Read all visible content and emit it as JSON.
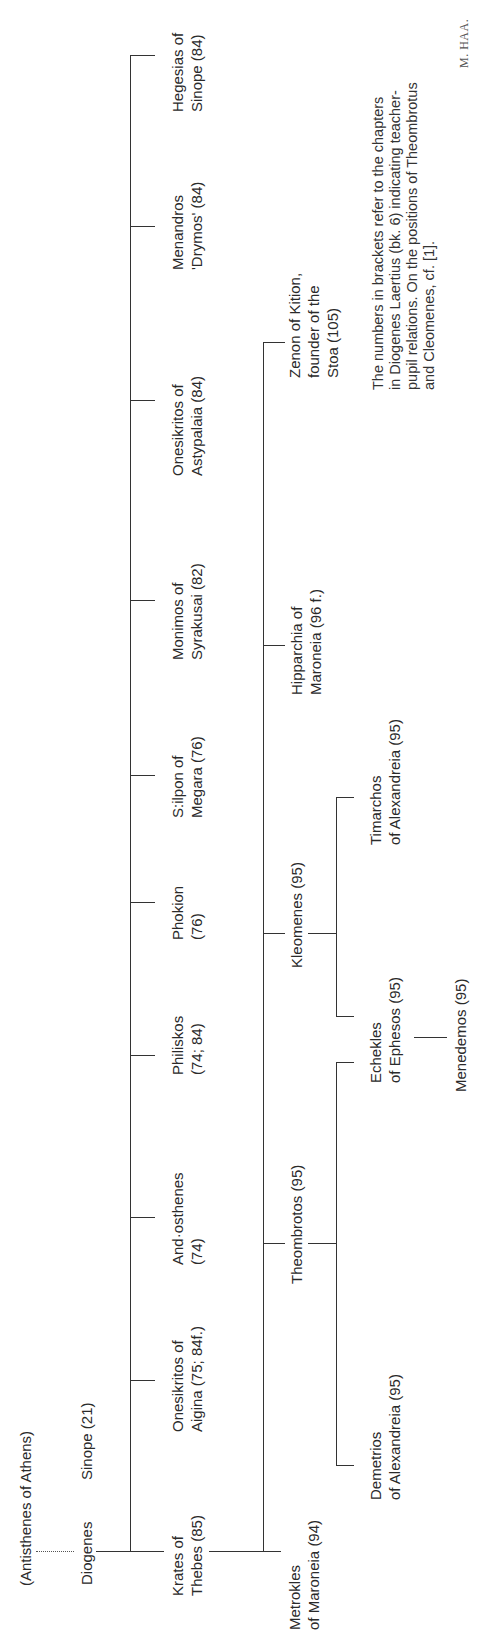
{
  "diagram": {
    "orientation": "rotated-90-ccw",
    "root": {
      "label": "(Antisthenes of Athens)"
    },
    "diogenes": {
      "line1": "Diogenes",
      "line2": "Sinope (21)"
    },
    "pupils_of_diogenes": [
      {
        "line1": "Krates of",
        "line2": "Thebes (85)"
      },
      {
        "line1": "Onesikritos of",
        "line2": "Aigina (75; 84f.)"
      },
      {
        "line1": "And·osthenes",
        "line2": "(74)"
      },
      {
        "line1": "Philiskos",
        "line2": "(74; 84)"
      },
      {
        "line1": "Phokion",
        "line2": "(76)"
      },
      {
        "line1": "S:ilpon of",
        "line2": "Megara (76)"
      },
      {
        "line1": "Monimos of",
        "line2": "Syrakusai (82)"
      },
      {
        "line1": "Onesikritos of",
        "line2": "Astypalaia (84)"
      },
      {
        "line1": "Menandros",
        "line2": "'Drymos' (84)"
      },
      {
        "line1": "Hegesias of",
        "line2": "Sinope (84)"
      }
    ],
    "pupils_of_krates": [
      {
        "line1": "Metrokles",
        "line2": "of Maroneia (94)"
      },
      {
        "line1": "Theombrotos (95)"
      },
      {
        "line1": "Kleomenes (95)"
      },
      {
        "line1": "Hipparchia of",
        "line2": "Maroneia (96 f.)"
      },
      {
        "line1": "Zenon of Kition,",
        "line2": "founder of the",
        "line3": "Stoa (105)"
      }
    ],
    "pupils_of_theombrotos": [
      {
        "line1": "Demetrios",
        "line2": "of Alexandreia (95)"
      },
      {
        "line1": "Echekles",
        "line2": "of Ephesos (95)"
      }
    ],
    "pupils_of_kleomenes": [
      {
        "line1": "Echekles",
        "line2": "of Ephesos (95)"
      },
      {
        "line1": "Timarchos",
        "line2": "of Alexandreia (95)"
      }
    ],
    "pupils_of_echekles": [
      {
        "line1": "Menedemos (95)"
      }
    ],
    "note": {
      "line1": "The numbers in brackets refer to the chapters",
      "line2": "in Diogenes Laertius (bk. 6) indicating teacher-",
      "line3": "pupil relations. On the positions of Theombrotus",
      "line4": "and Cleomenes, cf. [1]."
    },
    "signature": "M. HAA."
  }
}
